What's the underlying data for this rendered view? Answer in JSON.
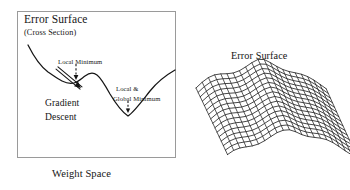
{
  "figure": {
    "type": "two-panel-diagram",
    "background_color": "#ffffff",
    "ink_color": "#151515",
    "box_border_color": "#9a9a9a"
  },
  "left_panel": {
    "name": "error-surface-cross-section",
    "title": "Error Surface",
    "subtitle": "(Cross Section)",
    "caption": "Weight Space",
    "annotations": {
      "local_minimum": "Local Minimum",
      "global_minimum_line1": "Local &",
      "global_minimum_line2": "Global Minimum",
      "gradient_line1": "Gradient",
      "gradient_line2": "Descent"
    },
    "curve": {
      "description": "error curve cross section with one local minimum and one global minimum",
      "path": "M 28,45 C 34,57 40,66 48,72 C 54,76 58,79 62,81 C 66,83 70,84 74,83 C 78,82 81,79 85,76 C 89,73 93,72 97,75 C 101,78 105,85 110,94 C 116,104 122,112 128,116 C 134,112 142,101 150,91 C 158,81 168,74 175,70",
      "local_minimum_point": [
        74,
        83
      ],
      "global_minimum_point": [
        128,
        116
      ],
      "start_point": [
        28,
        45
      ],
      "end_point": [
        175,
        70
      ]
    },
    "gradient_arrow": {
      "description": "solid double-stroke arrow along descending slope",
      "from": [
        57,
        68
      ],
      "to": [
        81,
        88
      ]
    },
    "local_min_arrow": {
      "description": "vertical dashed arrow pointing down to local minimum",
      "from": [
        76,
        64
      ],
      "to": [
        76,
        80
      ]
    },
    "global_min_arrow": {
      "description": "short vertical dashed arrow pointing down to global minimum",
      "from": [
        128,
        101
      ],
      "to": [
        128,
        113
      ]
    }
  },
  "right_panel": {
    "name": "error-surface-mesh",
    "title": "Error Surface",
    "mesh": {
      "description": "3D wireframe mesh of a wavy valley-shaped error surface",
      "rows": 16,
      "cols": 22,
      "origin": [
        196,
        62
      ],
      "cell_width": 6.2,
      "row_offset_x": 2.1,
      "row_offset_y": 4.6,
      "valley_depth": 26,
      "ripple_amplitude": 3.4,
      "ripple_frequency": 2.6,
      "line_color": "#151515"
    }
  }
}
